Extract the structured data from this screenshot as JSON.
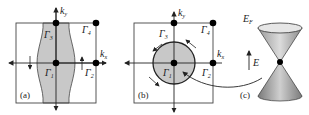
{
  "panels": {
    "a": {
      "label": "(a)",
      "points": {
        "g1": "Γ",
        "g1_sub": "1",
        "g2": "Γ",
        "g2_sub": "2",
        "g3": "Γ",
        "g3_sub": "3",
        "g4": "Γ",
        "g4_sub": "4"
      },
      "axes": {
        "kx": "k",
        "kx_sub": "x",
        "ky": "k",
        "ky_sub": "y"
      }
    },
    "b": {
      "label": "(b)",
      "points": {
        "g1": "Γ",
        "g1_sub": "1",
        "g2": "Γ",
        "g2_sub": "2",
        "g3": "Γ",
        "g3_sub": "3",
        "g4": "Γ",
        "g4_sub": "4"
      },
      "axes": {
        "kx": "k",
        "kx_sub": "x",
        "ky": "k",
        "ky_sub": "y"
      }
    },
    "c": {
      "label": "(c)",
      "fermi_level": "E",
      "fermi_sub": "F",
      "energy_axis": "E"
    }
  },
  "colors": {
    "line": "#333333",
    "fill": "#c8c8c8",
    "dot": "#000000"
  }
}
